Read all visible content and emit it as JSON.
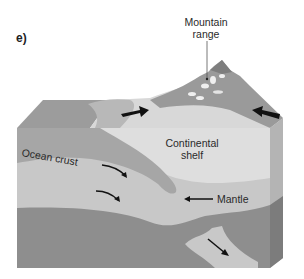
{
  "panel_label": "e)",
  "labels": {
    "mountain_range_line1": "Mountain",
    "mountain_range_line2": "range",
    "continental_shelf_line1": "Continental",
    "continental_shelf_line2": "shelf",
    "ocean_crust": "Ocean crust",
    "mantle": "Mantle"
  },
  "colors": {
    "background": "#ffffff",
    "continental_crust": "#dcdcdc",
    "ocean_crust": "#a8a8a8",
    "mantle": "#c4c4c4",
    "deep_layer": "#8c8c8c",
    "ocean_surface": "#a0a0a0",
    "mountains": "#9a9a9a",
    "arrows": "#111111"
  }
}
